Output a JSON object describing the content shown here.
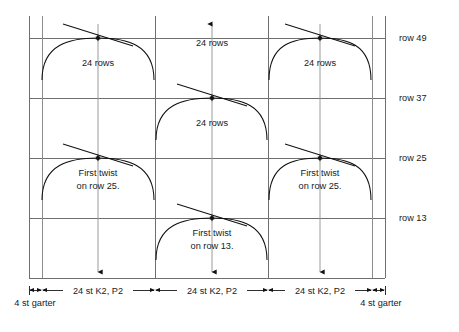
{
  "diagram": {
    "type": "knitting-cable-chart",
    "row_labels": [
      {
        "id": "row-49",
        "text": "row 49",
        "y": 38
      },
      {
        "id": "row-37",
        "text": "row 37",
        "y": 98
      },
      {
        "id": "row-25",
        "text": "row 25",
        "y": 158
      },
      {
        "id": "row-13",
        "text": "row 13",
        "y": 218
      }
    ],
    "panel_annotations": [
      {
        "id": "ann-left-top",
        "lines": [
          "24 rows"
        ],
        "x": 98,
        "y": 66
      },
      {
        "id": "ann-center-top",
        "lines": [
          "24 rows"
        ],
        "x": 212,
        "y": 46
      },
      {
        "id": "ann-right-top",
        "lines": [
          "24 rows"
        ],
        "x": 320,
        "y": 66
      },
      {
        "id": "ann-center-mid",
        "lines": [
          "24 rows"
        ],
        "x": 212,
        "y": 126
      },
      {
        "id": "ann-left-twist",
        "lines": [
          "First twist",
          "on row 25."
        ],
        "x": 98,
        "y": 178
      },
      {
        "id": "ann-right-twist",
        "lines": [
          "First twist",
          "on row 25."
        ],
        "x": 320,
        "y": 178
      },
      {
        "id": "ann-center-twist",
        "lines": [
          "First twist",
          "on row 13."
        ],
        "x": 212,
        "y": 238
      }
    ],
    "dimension_labels": [
      {
        "id": "dim-panel-1",
        "text": "24 st K2, P2",
        "x": 98,
        "y": 288
      },
      {
        "id": "dim-panel-2",
        "text": "24 st K2, P2",
        "x": 212,
        "y": 288
      },
      {
        "id": "dim-panel-3",
        "text": "24 st K2, P2",
        "x": 320,
        "y": 288
      }
    ],
    "edge_labels": [
      {
        "id": "garter-left",
        "text": "4 st garter",
        "x": 35,
        "y": 303
      },
      {
        "id": "garter-right",
        "text": "4 st garter",
        "x": 381,
        "y": 303
      }
    ],
    "colors": {
      "grid": "#6f6f6f",
      "cable": "#111111",
      "text": "#1a1a1a",
      "background": "#ffffff",
      "center_guide": "#9a9a9a"
    },
    "geometry": {
      "left_border_x": 29,
      "left_inner_x": 42,
      "right_inner_x": 372,
      "right_border_x": 385,
      "divider_1_x": 155,
      "divider_2_x": 268,
      "top_y": 38,
      "bottom_y": 278,
      "row_spacing": 60,
      "panel_centers": [
        98,
        212,
        320
      ]
    }
  }
}
